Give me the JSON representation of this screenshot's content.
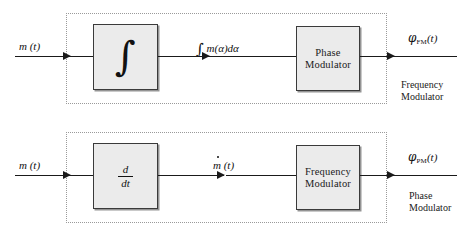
{
  "diagram": {
    "type": "block-diagram",
    "colors": {
      "block_fill": "#ebebeb",
      "block_border": "#3a3a3a",
      "wire": "#1a1a1a",
      "frame_dotted": "#9a9a9a",
      "background": "#ffffff"
    },
    "rows": [
      {
        "id": "frequency-modulator",
        "input_label": "m (t)",
        "block": {
          "kind": "integrator",
          "glyph": "∫",
          "label_line1": "",
          "label_line2": ""
        },
        "intermediate_label_integral": "∫",
        "intermediate_label_rest": " m(α)dα",
        "second_block": {
          "label_line1": "Phase",
          "label_line2": "Modulator"
        },
        "output_symbol": "φ",
        "output_subscript": "FM",
        "output_arg": "(t)",
        "caption_line1": "Frequency",
        "caption_line2": "Modulator"
      },
      {
        "id": "phase-modulator",
        "input_label": "m (t)",
        "block": {
          "kind": "differentiator",
          "numerator": "d",
          "denominator": "dt"
        },
        "intermediate_label_m": "m",
        "intermediate_label_arg": " (t)",
        "second_block": {
          "label_line1": "Frequency",
          "label_line2": "Modulator"
        },
        "output_symbol": "φ",
        "output_subscript": "PM",
        "output_arg": "(t)",
        "caption_line1": "Phase",
        "caption_line2": "Modulator"
      }
    ]
  }
}
